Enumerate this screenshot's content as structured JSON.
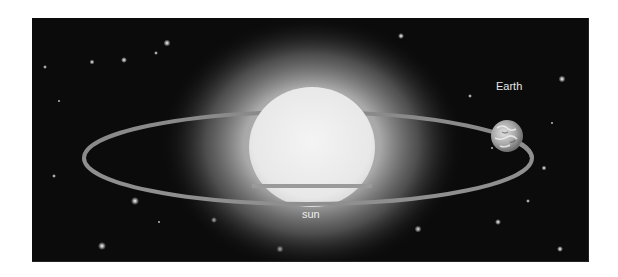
{
  "diagram": {
    "type": "orbit-illustration",
    "labels": {
      "earth": "Earth",
      "sun": "sun"
    },
    "colors": {
      "background": "#0b0b0b",
      "sun_core": "#ececec",
      "sun_glow": "#bdbdbd",
      "orbit": "#8a8a8a",
      "earth": "#b5b5b5",
      "label": "#e6e6e6",
      "page": "#ffffff"
    },
    "elements": [
      {
        "id": "sun",
        "shape": "circle",
        "label_key": "sun"
      },
      {
        "id": "orbit",
        "shape": "ellipse"
      },
      {
        "id": "earth",
        "shape": "circle",
        "label_key": "earth"
      }
    ]
  }
}
